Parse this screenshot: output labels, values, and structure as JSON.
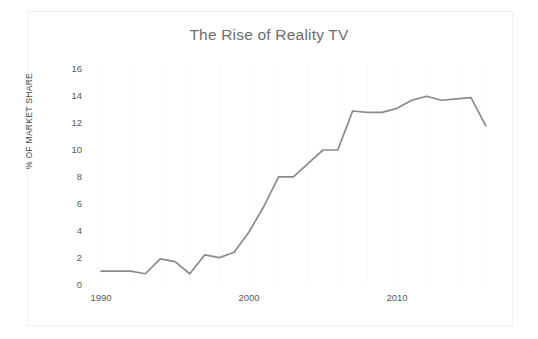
{
  "chart_data": {
    "type": "line",
    "title": "The Rise of Reality TV",
    "xlabel": "",
    "ylabel": "% OF MARKET SHARE",
    "xlim": [
      1990,
      2016
    ],
    "ylim": [
      0,
      16
    ],
    "y_ticks": [
      0,
      2,
      4,
      6,
      8,
      10,
      12,
      14,
      16
    ],
    "x_ticks": [
      1990,
      2000,
      2010
    ],
    "x_tick_labels": [
      "1990",
      "2000",
      "2010"
    ],
    "y_tick_labels": [
      "0",
      "2",
      "4",
      "6",
      "8",
      "10",
      "12",
      "14",
      "16"
    ],
    "grid": "faint vertical gridlines only",
    "legend": "none",
    "line_color": "#8a8a8a",
    "series": [
      {
        "name": "% of market share",
        "x": [
          1990,
          1991,
          1992,
          1993,
          1994,
          1995,
          1996,
          1997,
          1998,
          1999,
          2000,
          2001,
          2002,
          2003,
          2004,
          2005,
          2006,
          2007,
          2008,
          2009,
          2010,
          2011,
          2012,
          2013,
          2014,
          2015,
          2016
        ],
        "values": [
          1.0,
          1.0,
          1.0,
          0.8,
          1.9,
          1.7,
          0.8,
          2.2,
          2.0,
          2.4,
          3.9,
          5.8,
          8.0,
          8.0,
          9.0,
          10.0,
          10.0,
          12.9,
          12.8,
          12.8,
          13.1,
          13.7,
          14.0,
          13.7,
          13.8,
          13.9,
          11.8
        ]
      }
    ]
  },
  "axis": {
    "y_title": "% OF MARKET SHARE"
  }
}
